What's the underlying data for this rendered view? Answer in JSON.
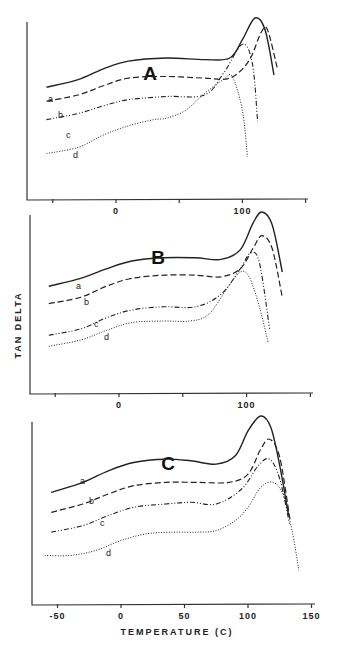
{
  "chart_data": [
    {
      "type": "line",
      "title": "A",
      "xlabel": "",
      "ylabel": "TAN DELTA",
      "xlim": [
        -70,
        150
      ],
      "x_ticks": [
        -50,
        0,
        50,
        100,
        150
      ],
      "x_tick_labels": [
        "",
        "0",
        "",
        "100",
        ""
      ],
      "y_ticks": [],
      "grid": false,
      "legend": "inline labels a, b, c, d",
      "series": [
        {
          "name": "a",
          "style": "solid",
          "x": [
            -55,
            -30,
            -10,
            10,
            40,
            70,
            90,
            100,
            110,
            118,
            125
          ],
          "y": [
            0.55,
            0.6,
            0.67,
            0.72,
            0.74,
            0.73,
            0.74,
            0.86,
            1.0,
            0.92,
            0.63
          ]
        },
        {
          "name": "b",
          "style": "dashed",
          "x": [
            -55,
            -30,
            -10,
            10,
            40,
            70,
            90,
            105,
            115,
            120,
            128
          ],
          "y": [
            0.46,
            0.5,
            0.56,
            0.61,
            0.62,
            0.61,
            0.61,
            0.72,
            0.91,
            0.92,
            0.66
          ]
        },
        {
          "name": "c",
          "style": "dash-dot",
          "x": [
            -55,
            -30,
            -10,
            10,
            40,
            70,
            85,
            100,
            108,
            112
          ],
          "y": [
            0.34,
            0.38,
            0.43,
            0.47,
            0.49,
            0.5,
            0.64,
            0.83,
            0.7,
            0.33
          ]
        },
        {
          "name": "d",
          "style": "dotted",
          "x": [
            -55,
            -30,
            -10,
            10,
            30,
            40,
            55,
            70,
            85,
            92,
            100,
            104
          ],
          "y": [
            0.12,
            0.16,
            0.24,
            0.3,
            0.34,
            0.35,
            0.4,
            0.51,
            0.6,
            0.62,
            0.4,
            0.1
          ]
        }
      ]
    },
    {
      "type": "line",
      "title": "B",
      "xlabel": "",
      "ylabel": "TAN DELTA",
      "xlim": [
        -70,
        150
      ],
      "x_ticks": [
        -50,
        0,
        50,
        100,
        150
      ],
      "x_tick_labels": [
        "",
        "0",
        "",
        "100",
        ""
      ],
      "y_ticks": [],
      "grid": false,
      "legend": "inline labels a, b, c, d",
      "series": [
        {
          "name": "a",
          "style": "solid",
          "x": [
            -55,
            -30,
            -10,
            10,
            35,
            60,
            80,
            95,
            105,
            112,
            120,
            128
          ],
          "y": [
            0.53,
            0.58,
            0.64,
            0.69,
            0.71,
            0.71,
            0.7,
            0.76,
            0.93,
            1.0,
            0.92,
            0.62
          ]
        },
        {
          "name": "b",
          "style": "dashed",
          "x": [
            -55,
            -30,
            -10,
            10,
            35,
            60,
            80,
            95,
            105,
            112,
            120,
            128
          ],
          "y": [
            0.42,
            0.46,
            0.53,
            0.58,
            0.6,
            0.6,
            0.59,
            0.64,
            0.77,
            0.85,
            0.77,
            0.46
          ]
        },
        {
          "name": "c",
          "style": "dash-dot",
          "x": [
            -55,
            -30,
            -10,
            10,
            35,
            60,
            80,
            95,
            103,
            110,
            118
          ],
          "y": [
            0.22,
            0.26,
            0.33,
            0.38,
            0.4,
            0.4,
            0.48,
            0.64,
            0.74,
            0.68,
            0.26
          ]
        },
        {
          "name": "d",
          "style": "dotted",
          "x": [
            -55,
            -30,
            -10,
            10,
            35,
            55,
            70,
            85,
            95,
            102,
            110,
            117
          ],
          "y": [
            0.15,
            0.19,
            0.25,
            0.3,
            0.31,
            0.31,
            0.35,
            0.52,
            0.62,
            0.59,
            0.4,
            0.17
          ]
        }
      ]
    },
    {
      "type": "line",
      "title": "C",
      "xlabel": "TEMPERATURE (C)",
      "ylabel": "TAN DELTA",
      "xlim": [
        -70,
        150
      ],
      "x_ticks": [
        -50,
        0,
        50,
        100,
        150
      ],
      "x_tick_labels": [
        "-50",
        "0",
        "50",
        "100",
        "150"
      ],
      "y_ticks": [],
      "grid": false,
      "legend": "inline labels a, b, c, d",
      "series": [
        {
          "name": "a",
          "style": "solid",
          "x": [
            -55,
            -30,
            -10,
            10,
            35,
            55,
            75,
            90,
            100,
            110,
            118,
            125,
            132
          ],
          "y": [
            0.54,
            0.6,
            0.67,
            0.72,
            0.74,
            0.73,
            0.71,
            0.76,
            0.91,
            1.0,
            0.93,
            0.7,
            0.4
          ]
        },
        {
          "name": "b",
          "style": "dashed",
          "x": [
            -55,
            -30,
            -10,
            10,
            35,
            60,
            85,
            100,
            110,
            117,
            125,
            133
          ],
          "y": [
            0.42,
            0.47,
            0.53,
            0.58,
            0.6,
            0.6,
            0.6,
            0.65,
            0.8,
            0.86,
            0.75,
            0.38
          ]
        },
        {
          "name": "c",
          "style": "dash-dot",
          "x": [
            -55,
            -30,
            -10,
            10,
            35,
            55,
            75,
            95,
            108,
            117,
            125,
            133
          ],
          "y": [
            0.3,
            0.34,
            0.4,
            0.45,
            0.47,
            0.48,
            0.47,
            0.56,
            0.7,
            0.74,
            0.62,
            0.34
          ]
        },
        {
          "name": "d",
          "style": "dotted",
          "x": [
            -60,
            -40,
            -20,
            0,
            20,
            40,
            60,
            75,
            90,
            100,
            110,
            120,
            128,
            135,
            140
          ],
          "y": [
            0.16,
            0.16,
            0.19,
            0.25,
            0.29,
            0.3,
            0.3,
            0.31,
            0.37,
            0.45,
            0.57,
            0.6,
            0.52,
            0.3,
            0.07
          ]
        }
      ]
    }
  ],
  "figure": {
    "ylabel": "TAN DELTA",
    "xlabel": "TEMPERATURE (C)",
    "panels": [
      {
        "title": "A",
        "ticks": [
          "",
          "0",
          "",
          "100",
          ""
        ],
        "labels": [
          "a",
          "b",
          "c",
          "d"
        ]
      },
      {
        "title": "B",
        "ticks": [
          "",
          "0",
          "",
          "100",
          ""
        ],
        "labels": [
          "a",
          "b",
          "c",
          "d"
        ]
      },
      {
        "title": "C",
        "ticks": [
          "-50",
          "0",
          "50",
          "100",
          "150"
        ],
        "labels": [
          "a",
          "b",
          "c",
          "d"
        ]
      }
    ]
  }
}
